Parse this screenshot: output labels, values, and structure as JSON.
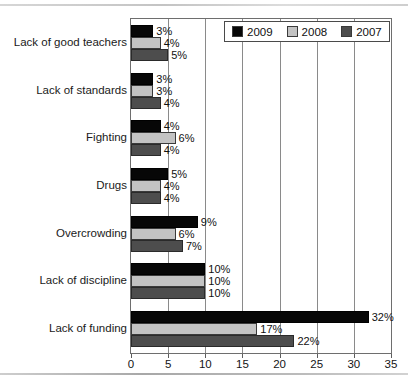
{
  "chart_data": {
    "type": "bar",
    "orientation": "horizontal",
    "title": "",
    "xlabel": "",
    "ylabel": "",
    "xlim": [
      0,
      35
    ],
    "xticks": [
      0,
      5,
      10,
      15,
      20,
      25,
      30,
      35
    ],
    "grid": true,
    "legend_position": "top-right",
    "value_suffix": "%",
    "categories": [
      "Lack of good teachers",
      "Lack of standards",
      "Fighting",
      "Drugs",
      "Overcrowding",
      "Lack of discipline",
      "Lack of funding"
    ],
    "series": [
      {
        "name": "2009",
        "color": "#070707",
        "values": [
          3,
          3,
          4,
          5,
          9,
          10,
          32
        ],
        "labels": [
          "3%",
          "3%",
          "4%",
          "5%",
          "9%",
          "10%",
          "32%"
        ]
      },
      {
        "name": "2008",
        "color": "#c3c3c3",
        "values": [
          4,
          3,
          6,
          4,
          6,
          10,
          17
        ],
        "labels": [
          "4%",
          "3%",
          "6%",
          "4%",
          "6%",
          "10%",
          "17%"
        ]
      },
      {
        "name": "2007",
        "color": "#4d4d4d",
        "values": [
          5,
          4,
          4,
          4,
          7,
          10,
          22
        ],
        "labels": [
          "5%",
          "4%",
          "4%",
          "4%",
          "7%",
          "10%",
          "22%"
        ]
      }
    ]
  },
  "legend": {
    "items": [
      {
        "label": "2009",
        "color": "#070707"
      },
      {
        "label": "2008",
        "color": "#c3c3c3"
      },
      {
        "label": "2007",
        "color": "#4d4d4d"
      }
    ]
  },
  "axis": {
    "tick_labels": [
      "0",
      "5",
      "10",
      "15",
      "20",
      "25",
      "30",
      "35"
    ]
  }
}
